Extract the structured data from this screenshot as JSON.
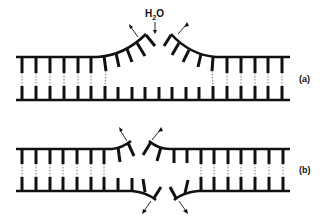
{
  "diagram": {
    "panels": [
      {
        "id": "a",
        "label": "(a)",
        "annotation": {
          "molecule": "H",
          "subscript": "2",
          "suffix": "O"
        },
        "description": "Duplex DNA with single-strand break on top strand; hydrolysis by water at the nick site with strand ends peeling back"
      },
      {
        "id": "b",
        "label": "(b)",
        "description": "Duplex DNA with staggered double-strand break; both strands split with ends peeling apart"
      }
    ],
    "colors": {
      "ink": "#111111",
      "background": "#ffffff"
    }
  }
}
